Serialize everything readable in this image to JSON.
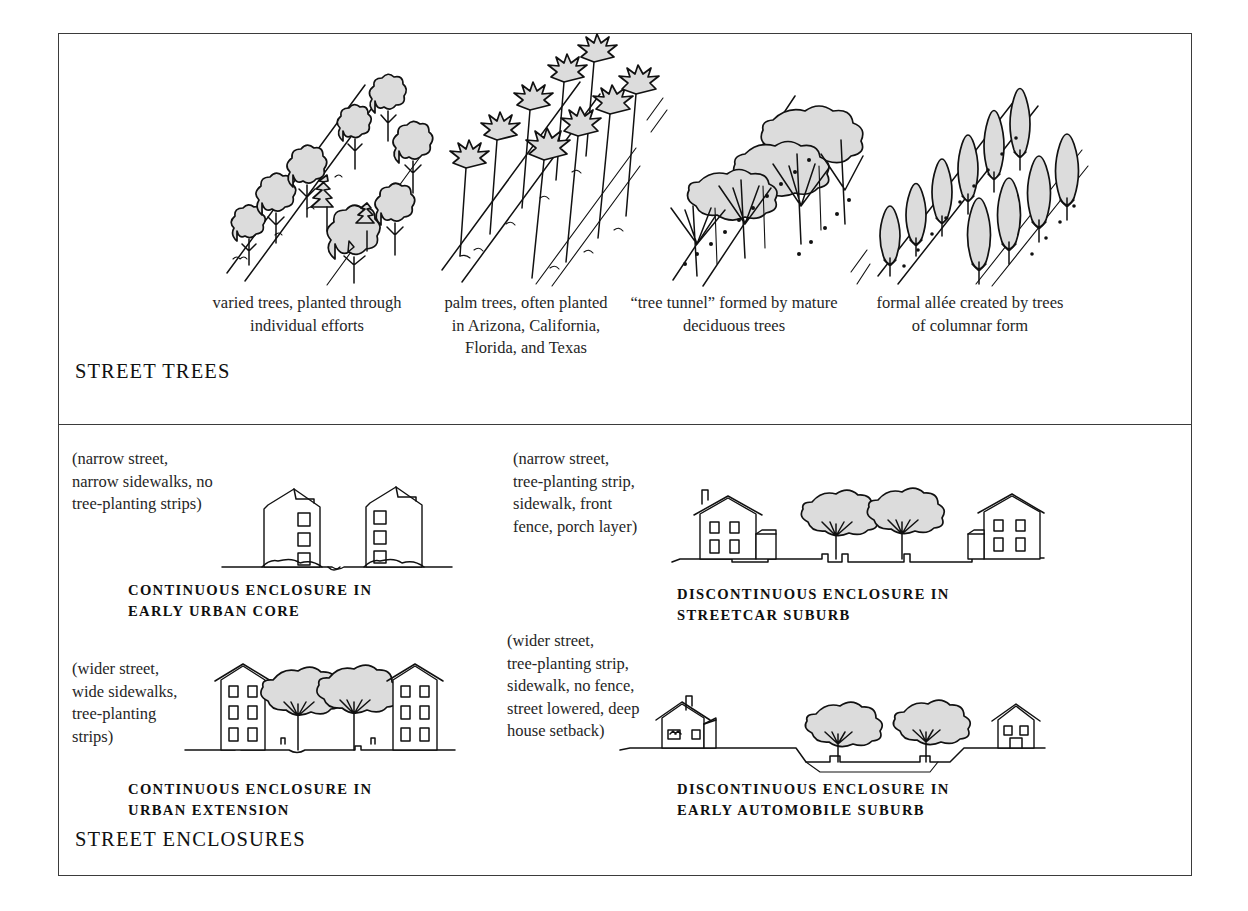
{
  "figure": {
    "sections": [
      {
        "id": "street-trees",
        "title": "STREET TREES"
      },
      {
        "id": "street-enclosures",
        "title": "STREET ENCLOSURES"
      }
    ]
  },
  "street_trees": {
    "items": [
      {
        "id": "varied",
        "caption": "varied trees, planted through individual efforts",
        "art": "varied-trees-perspective-illustration"
      },
      {
        "id": "palm",
        "caption": "palm trees, often planted in Arizona, California, Florida, and Texas",
        "art": "palm-trees-perspective-illustration"
      },
      {
        "id": "tunnel",
        "caption": "“tree tunnel” formed by mature deciduous trees",
        "art": "tree-tunnel-perspective-illustration"
      },
      {
        "id": "allee",
        "caption": "formal allée created by trees of columnar form",
        "art": "columnar-allee-perspective-illustration"
      }
    ]
  },
  "street_enclosures": {
    "items": [
      {
        "id": "early-urban-core",
        "parenthetical": "(narrow street,\nnarrow sidewalks, no\ntree-planting strips)",
        "title": "CONTINUOUS ENCLOSURE IN\nEARLY URBAN CORE",
        "art": "continuous-enclosure-early-urban-core-elevation"
      },
      {
        "id": "streetcar-suburb",
        "parenthetical": "(narrow street,\ntree-planting strip,\nsidewalk, front\nfence, porch layer)",
        "title": "DISCONTINUOUS ENCLOSURE IN\nSTREETCAR SUBURB",
        "art": "discontinuous-enclosure-streetcar-suburb-elevation"
      },
      {
        "id": "urban-extension",
        "parenthetical": "(wider street,\nwide sidewalks,\ntree-planting\nstrips)",
        "title": "CONTINUOUS ENCLOSURE IN\nURBAN EXTENSION",
        "art": "continuous-enclosure-urban-extension-elevation"
      },
      {
        "id": "early-automobile-suburb",
        "parenthetical": "(wider street,\ntree-planting strip,\nsidewalk, no fence,\nstreet lowered, deep\nhouse setback)",
        "title": "DISCONTINUOUS ENCLOSURE IN\nEARLY AUTOMOBILE SUBURB",
        "art": "discontinuous-enclosure-early-automobile-suburb-elevation"
      }
    ]
  },
  "colors": {
    "ink": "#111111",
    "frame": "#3b3b3b",
    "foliage_fill": "#dcdcdc",
    "background": "#ffffff"
  }
}
